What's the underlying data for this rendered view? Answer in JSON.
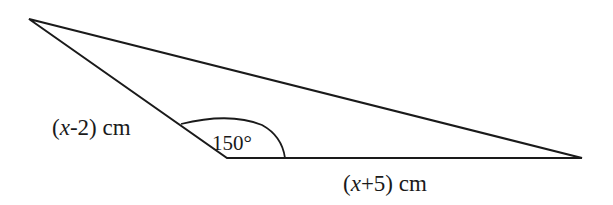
{
  "figure": {
    "type": "triangle",
    "vertices": {
      "top_left": [
        29,
        19
      ],
      "bottom": [
        227,
        158
      ],
      "right": [
        582,
        158
      ]
    },
    "stroke_color": "#1a1a1a",
    "background": "#ffffff"
  },
  "labels": {
    "side_left": {
      "open": "(",
      "var": "x",
      "rest": "-2) cm"
    },
    "side_bottom": {
      "open": "(",
      "var": "x",
      "rest": "+5) cm"
    },
    "angle": "150°"
  }
}
